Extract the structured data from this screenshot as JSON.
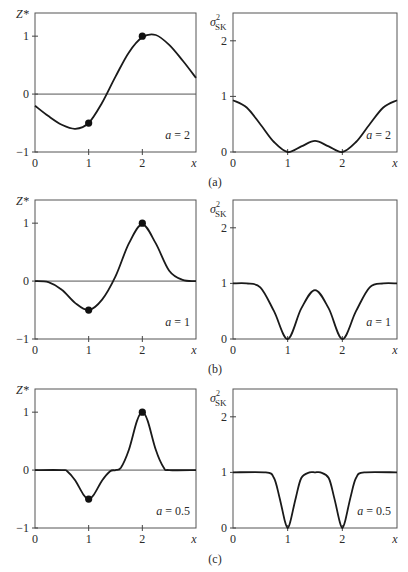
{
  "figure": {
    "rows": [
      {
        "label": "(a)",
        "a_label": "a = 2"
      },
      {
        "label": "(b)",
        "a_label": "a = 1"
      },
      {
        "label": "(c)",
        "a_label": "a = 0.5"
      }
    ],
    "left_ylabel": "Z*",
    "right_ylabel_base": "σ",
    "right_ylabel_sup": "2",
    "right_ylabel_sub": "SK",
    "xlabel": "x",
    "left_yticks": [
      "1",
      "0",
      "−1"
    ],
    "right_yticks": [
      "2",
      "1",
      "0"
    ],
    "xticks": [
      "0",
      "1",
      "2"
    ]
  },
  "chart_data": [
    {
      "type": "line",
      "panel": "a-left",
      "title": "(a)",
      "annotation": "a = 2",
      "xlabel": "x",
      "ylabel": "Z*",
      "xlim": [
        0,
        3
      ],
      "ylim": [
        -1,
        1.4
      ],
      "grid": false,
      "x": [
        0,
        0.25,
        0.5,
        0.75,
        1.0,
        1.25,
        1.5,
        1.75,
        2.0,
        2.25,
        2.5,
        2.75,
        3.0
      ],
      "values": [
        -0.2,
        -0.38,
        -0.53,
        -0.6,
        -0.5,
        -0.15,
        0.3,
        0.72,
        0.98,
        1.02,
        0.85,
        0.58,
        0.28
      ],
      "points": [
        {
          "x": 1,
          "y": -0.5
        },
        {
          "x": 2,
          "y": 1.0
        }
      ]
    },
    {
      "type": "line",
      "panel": "a-right",
      "title": "(a)",
      "annotation": "a = 2",
      "xlabel": "x",
      "ylabel": "σ²SK",
      "xlim": [
        0,
        3
      ],
      "ylim": [
        0,
        2.5
      ],
      "grid": false,
      "x": [
        0,
        0.25,
        0.5,
        0.75,
        1.0,
        1.25,
        1.5,
        1.75,
        2.0,
        2.25,
        2.5,
        2.75,
        3.0
      ],
      "values": [
        0.93,
        0.8,
        0.5,
        0.18,
        0.0,
        0.1,
        0.2,
        0.1,
        0.0,
        0.18,
        0.5,
        0.8,
        0.93
      ]
    },
    {
      "type": "line",
      "panel": "b-left",
      "title": "(b)",
      "annotation": "a = 1",
      "xlabel": "x",
      "ylabel": "Z*",
      "xlim": [
        0,
        3
      ],
      "ylim": [
        -1,
        1.4
      ],
      "grid": false,
      "x": [
        0,
        0.25,
        0.5,
        0.75,
        1.0,
        1.25,
        1.5,
        1.75,
        2.0,
        2.25,
        2.5,
        2.75,
        3.0
      ],
      "values": [
        0.0,
        -0.02,
        -0.15,
        -0.38,
        -0.5,
        -0.32,
        0.08,
        0.65,
        0.98,
        0.65,
        0.18,
        0.02,
        0.0
      ],
      "points": [
        {
          "x": 1,
          "y": -0.5
        },
        {
          "x": 2,
          "y": 1.0
        }
      ]
    },
    {
      "type": "line",
      "panel": "b-right",
      "title": "(b)",
      "annotation": "a = 1",
      "xlabel": "x",
      "ylabel": "σ²SK",
      "xlim": [
        0,
        3
      ],
      "ylim": [
        0,
        2.5
      ],
      "grid": false,
      "x": [
        0,
        0.25,
        0.5,
        0.75,
        1.0,
        1.25,
        1.5,
        1.75,
        2.0,
        2.25,
        2.5,
        2.75,
        3.0
      ],
      "values": [
        1.0,
        1.0,
        0.93,
        0.5,
        0.0,
        0.55,
        0.88,
        0.55,
        0.0,
        0.5,
        0.93,
        1.0,
        1.0
      ]
    },
    {
      "type": "line",
      "panel": "c-left",
      "title": "(c)",
      "annotation": "a = 0.5",
      "xlabel": "x",
      "ylabel": "Z*",
      "xlim": [
        0,
        3
      ],
      "ylim": [
        -1,
        1.4
      ],
      "grid": false,
      "x": [
        0,
        0.5,
        0.6,
        0.75,
        0.9,
        1.0,
        1.1,
        1.25,
        1.4,
        1.5,
        1.6,
        1.75,
        1.9,
        2.0,
        2.1,
        2.25,
        2.4,
        2.5,
        3.0
      ],
      "values": [
        0.0,
        0.0,
        -0.02,
        -0.18,
        -0.42,
        -0.5,
        -0.42,
        -0.18,
        -0.02,
        0.0,
        0.04,
        0.35,
        0.85,
        1.0,
        0.85,
        0.35,
        0.04,
        0.0,
        0.0
      ],
      "points": [
        {
          "x": 1,
          "y": -0.5
        },
        {
          "x": 2,
          "y": 1.0
        }
      ]
    },
    {
      "type": "line",
      "panel": "c-right",
      "title": "(c)",
      "annotation": "a = 0.5",
      "xlabel": "x",
      "ylabel": "σ²SK",
      "xlim": [
        0,
        3
      ],
      "ylim": [
        0,
        2.5
      ],
      "grid": false,
      "x": [
        0,
        0.6,
        0.75,
        0.85,
        0.95,
        1.0,
        1.05,
        1.15,
        1.25,
        1.4,
        1.5,
        1.6,
        1.75,
        1.85,
        1.95,
        2.0,
        2.05,
        2.15,
        2.25,
        2.4,
        3.0
      ],
      "values": [
        1.0,
        1.0,
        0.9,
        0.55,
        0.12,
        0.0,
        0.12,
        0.55,
        0.9,
        1.0,
        1.0,
        1.0,
        0.9,
        0.55,
        0.12,
        0.0,
        0.12,
        0.55,
        0.9,
        1.0,
        1.0
      ]
    }
  ]
}
